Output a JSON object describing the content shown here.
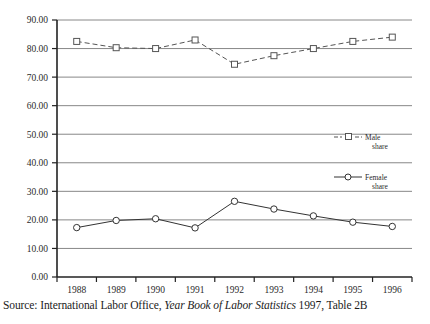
{
  "caption": {
    "prefix": "Source: International Labor Office,",
    "italic_title": "Year Book of Labor Statistics",
    "suffix": "1997, Table 2B"
  },
  "legend": {
    "male_line1": "Male",
    "male_line2": "share",
    "female_line1": "Female",
    "female_line2": "share"
  },
  "colors": {
    "gridline": "#7a7a7a",
    "axis": "#222222",
    "male_series": "#555555",
    "female_series": "#333333",
    "text": "#1c1c1c",
    "background": "#ffffff"
  },
  "chart_data": {
    "type": "line",
    "title": "",
    "xlabel": "",
    "ylabel": "",
    "grid": true,
    "legend_position": "right-middle",
    "categories": [
      "1988",
      "1989",
      "1990",
      "1991",
      "1992",
      "1993",
      "1994",
      "1995",
      "1996"
    ],
    "x": [
      1988,
      1989,
      1990,
      1991,
      1992,
      1993,
      1994,
      1995,
      1996
    ],
    "ylim": [
      0,
      90
    ],
    "ytick_labels": [
      "0.00",
      "10.00",
      "20.00",
      "30.00",
      "40.00",
      "50.00",
      "60.00",
      "70.00",
      "80.00",
      "90.00"
    ],
    "ytick_values": [
      0,
      10,
      20,
      30,
      40,
      50,
      60,
      70,
      80,
      90
    ],
    "series": [
      {
        "name": "Male share",
        "marker": "square",
        "linestyle": "dashed",
        "values": [
          82.5,
          80.3,
          80.0,
          83.0,
          74.5,
          77.5,
          80.0,
          82.5,
          84.0
        ]
      },
      {
        "name": "Female share",
        "marker": "circle",
        "linestyle": "solid",
        "values": [
          17.3,
          19.8,
          20.4,
          17.2,
          26.5,
          23.8,
          21.4,
          19.2,
          17.7
        ]
      }
    ]
  }
}
